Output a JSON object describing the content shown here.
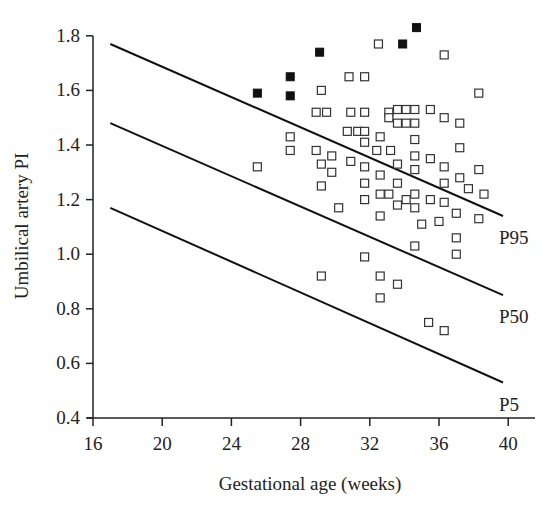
{
  "chart_data": {
    "type": "scatter",
    "title": "",
    "xlabel": "Gestational age (weeks)",
    "ylabel": "Umbilical artery PI",
    "xlim": [
      16,
      41.5
    ],
    "ylim": [
      0.4,
      1.8
    ],
    "xticks": [
      16,
      20,
      24,
      28,
      32,
      36,
      40
    ],
    "yticks": [
      0.4,
      0.6,
      0.8,
      1.0,
      1.2,
      1.4,
      1.6,
      1.8
    ],
    "ytick_labels": [
      "0.4",
      "0.6",
      "0.8",
      "1.0",
      "1.2",
      "1.4",
      "1.6",
      "1.8"
    ],
    "grid": false,
    "legend": null,
    "reference_lines": [
      {
        "name": "P95",
        "x": [
          17,
          39.7
        ],
        "y": [
          1.77,
          1.14
        ]
      },
      {
        "name": "P50",
        "x": [
          17,
          39.7
        ],
        "y": [
          1.48,
          0.85
        ]
      },
      {
        "name": "P5",
        "x": [
          17,
          39.7
        ],
        "y": [
          1.17,
          0.53
        ]
      }
    ],
    "series": [
      {
        "name": "filled",
        "marker": "filled-square",
        "points": [
          [
            25.5,
            1.59
          ],
          [
            27.4,
            1.65
          ],
          [
            27.4,
            1.58
          ],
          [
            29.1,
            1.74
          ],
          [
            33.9,
            1.77
          ],
          [
            34.7,
            1.83
          ]
        ]
      },
      {
        "name": "open",
        "marker": "open-square",
        "points": [
          [
            25.5,
            1.32
          ],
          [
            27.4,
            1.43
          ],
          [
            27.4,
            1.38
          ],
          [
            28.9,
            1.38
          ],
          [
            28.9,
            1.52
          ],
          [
            29.2,
            1.6
          ],
          [
            29.2,
            1.33
          ],
          [
            29.2,
            1.25
          ],
          [
            29.2,
            0.92
          ],
          [
            29.5,
            1.52
          ],
          [
            29.8,
            1.36
          ],
          [
            29.8,
            1.3
          ],
          [
            30.2,
            1.17
          ],
          [
            30.7,
            1.45
          ],
          [
            30.8,
            1.65
          ],
          [
            30.9,
            1.52
          ],
          [
            30.9,
            1.34
          ],
          [
            31.3,
            1.45
          ],
          [
            31.7,
            1.65
          ],
          [
            31.7,
            1.52
          ],
          [
            31.7,
            1.45
          ],
          [
            31.7,
            1.41
          ],
          [
            31.7,
            1.32
          ],
          [
            31.7,
            1.26
          ],
          [
            31.7,
            1.2
          ],
          [
            31.7,
            0.99
          ],
          [
            32.4,
            1.38
          ],
          [
            32.5,
            1.77
          ],
          [
            32.6,
            1.43
          ],
          [
            32.6,
            1.29
          ],
          [
            32.6,
            1.22
          ],
          [
            32.6,
            1.14
          ],
          [
            32.6,
            0.92
          ],
          [
            32.6,
            0.84
          ],
          [
            33.1,
            1.52
          ],
          [
            33.1,
            1.5
          ],
          [
            33.1,
            1.22
          ],
          [
            33.2,
            1.38
          ],
          [
            33.6,
            1.53
          ],
          [
            33.6,
            1.48
          ],
          [
            33.6,
            1.33
          ],
          [
            33.6,
            1.26
          ],
          [
            33.6,
            1.18
          ],
          [
            33.6,
            0.89
          ],
          [
            34.1,
            1.53
          ],
          [
            34.1,
            1.48
          ],
          [
            34.1,
            1.2
          ],
          [
            34.6,
            1.53
          ],
          [
            34.6,
            1.48
          ],
          [
            34.6,
            1.42
          ],
          [
            34.6,
            1.36
          ],
          [
            34.6,
            1.31
          ],
          [
            34.6,
            1.22
          ],
          [
            34.6,
            1.17
          ],
          [
            34.6,
            1.03
          ],
          [
            35.0,
            1.11
          ],
          [
            35.5,
            1.53
          ],
          [
            35.5,
            1.35
          ],
          [
            35.5,
            1.2
          ],
          [
            35.4,
            0.75
          ],
          [
            36.0,
            1.12
          ],
          [
            36.3,
            1.73
          ],
          [
            36.3,
            1.5
          ],
          [
            36.3,
            1.32
          ],
          [
            36.3,
            1.26
          ],
          [
            36.3,
            1.19
          ],
          [
            36.3,
            0.72
          ],
          [
            37.0,
            1.15
          ],
          [
            37.0,
            1.06
          ],
          [
            37.0,
            1.0
          ],
          [
            37.2,
            1.48
          ],
          [
            37.2,
            1.39
          ],
          [
            37.2,
            1.28
          ],
          [
            37.7,
            1.24
          ],
          [
            38.3,
            1.59
          ],
          [
            38.3,
            1.31
          ],
          [
            38.3,
            1.13
          ],
          [
            38.6,
            1.22
          ]
        ]
      }
    ]
  }
}
